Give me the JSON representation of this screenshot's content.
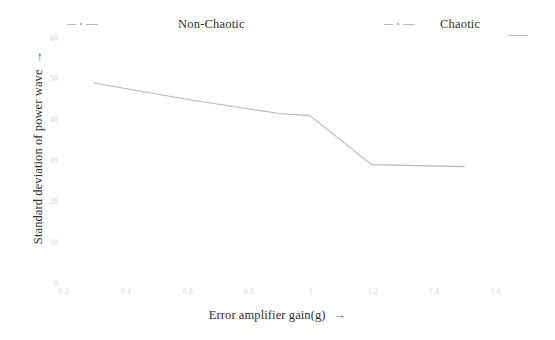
{
  "chart_data": {
    "type": "line",
    "title": "",
    "xlabel": "Error amplifier gain(g)",
    "ylabel": "Standard deviation of power wave",
    "xlim": [
      0.2,
      1.6
    ],
    "ylim": [
      0,
      60
    ],
    "grid": false,
    "legend_position": "top",
    "xticks": [
      "0.2",
      "0.4",
      "0.6",
      "0.8",
      "1",
      "1.2",
      "1.4",
      "1.6"
    ],
    "xtick_values": [
      0.2,
      0.4,
      0.6,
      0.8,
      1.0,
      1.2,
      1.4,
      1.6
    ],
    "yticks": [
      "60",
      "50",
      "40",
      "30",
      "20",
      "10",
      "0"
    ],
    "ytick_values": [
      60,
      50,
      40,
      30,
      20,
      10,
      0
    ],
    "legend": [
      {
        "name": "Non-Chaotic",
        "style": "dash-dot"
      },
      {
        "name": "Chaotic",
        "style": "dash-dot"
      }
    ],
    "series": [
      {
        "name": "Standard deviation of power wave",
        "x": [
          0.3,
          0.6,
          0.9,
          1.0,
          1.2,
          1.5
        ],
        "values": [
          49.0,
          45.0,
          41.5,
          41.0,
          29.0,
          28.5
        ]
      }
    ]
  },
  "axis": {
    "x_arrow": "→",
    "y_arrow": "→"
  }
}
